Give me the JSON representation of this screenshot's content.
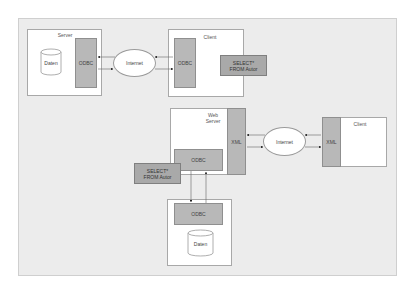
{
  "diagram": {
    "top": {
      "server": {
        "title": "Server",
        "db_label": "Daten",
        "connector_label": "ODBC"
      },
      "network": {
        "label": "Internet"
      },
      "client": {
        "title": "Client",
        "connector_label": "ODBC"
      },
      "query": {
        "line1": "SELECT*",
        "line2": "FROM Autor"
      }
    },
    "bottom": {
      "webserver": {
        "title_line1": "Web",
        "title_line2": "Server",
        "xml_label": "XML",
        "odbc_label": "ODBC"
      },
      "network": {
        "label": "Internet"
      },
      "client": {
        "title": "Client",
        "xml_label": "XML"
      },
      "query": {
        "line1": "SELECT*",
        "line2": "FROM Autor"
      },
      "dbserver": {
        "connector_label": "ODBC",
        "db_label": "Daten"
      }
    },
    "colors": {
      "background": "#ececec",
      "component": "#b8b8b8",
      "query": "#a9a9a9",
      "box": "#ffffff"
    }
  }
}
